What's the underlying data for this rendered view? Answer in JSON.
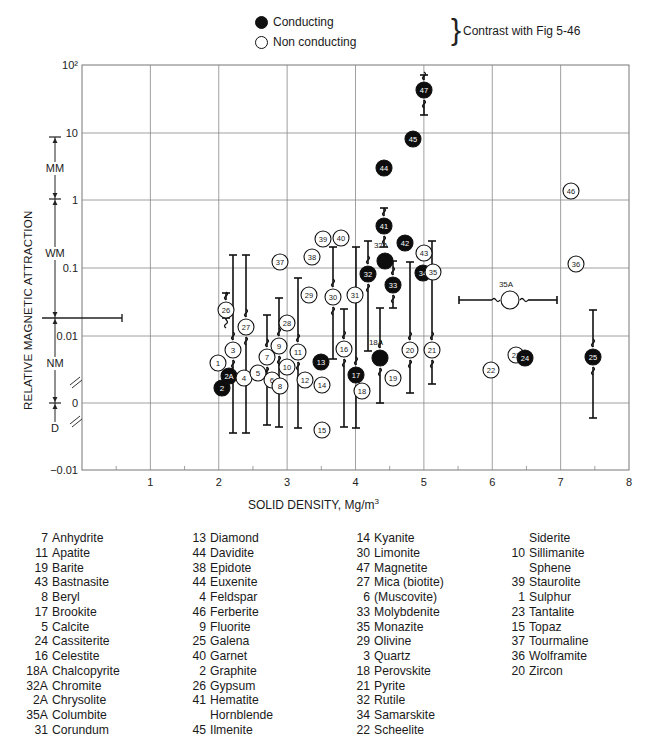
{
  "legend": {
    "conducting_label": "Conducting",
    "nonconducting_label": "Non conducting",
    "contrast_note": "Contrast with Fig 5-46"
  },
  "axes": {
    "x_title": "SOLID DENSITY, Mg/m",
    "x_title_sup": "3",
    "y_title": "RELATIVE MAGNETIC ATTRACTION",
    "x_ticks": [
      "1",
      "2",
      "3",
      "4",
      "5",
      "6",
      "7",
      "8"
    ],
    "y_ticks": [
      "10²",
      "10",
      "1",
      "0.1",
      "0.01",
      "0",
      "−0.01"
    ],
    "zones": [
      {
        "label": "MM",
        "from": "10",
        "to": "1"
      },
      {
        "label": "WM",
        "from": "1",
        "to": "0.02"
      },
      {
        "label": "NM",
        "from": "0.02",
        "to": "0"
      },
      {
        "label": "D",
        "from": "0",
        "to": "below 0"
      }
    ]
  },
  "chart_data": {
    "type": "scatter",
    "title": "",
    "xlabel": "SOLID DENSITY, Mg/m³",
    "ylabel": "RELATIVE MAGNETIC ATTRACTION",
    "xlim": [
      0,
      8
    ],
    "yscale": "log with linear break near 0",
    "y_ticks": [
      100,
      10,
      1,
      0.1,
      0.01,
      0,
      -0.01
    ],
    "x_ticks": [
      1,
      2,
      3,
      4,
      5,
      6,
      7,
      8
    ],
    "grid": true,
    "legend": [
      {
        "marker": "filled-circle",
        "label": "Conducting"
      },
      {
        "marker": "open-circle",
        "label": "Non conducting"
      }
    ],
    "legend_note": "Contrast with Fig 5-46",
    "zones": [
      {
        "label": "MM",
        "range": [
          1,
          10
        ]
      },
      {
        "label": "WM",
        "range": [
          0.02,
          1
        ]
      },
      {
        "label": "NM",
        "range": [
          0,
          0.02
        ]
      },
      {
        "label": "D",
        "range": [
          -0.005,
          0
        ]
      }
    ],
    "points": [
      {
        "id": "1",
        "density": 2.0,
        "px": 218,
        "py": 363,
        "conducting": false
      },
      {
        "id": "2",
        "density": 2.05,
        "px": 222,
        "py": 388,
        "conducting": true
      },
      {
        "id": "2A",
        "density": 2.15,
        "px": 229,
        "py": 376,
        "conducting": true
      },
      {
        "id": "3",
        "density": 2.2,
        "px": 233,
        "py": 350,
        "conducting": false,
        "bar": [
          255,
          433
        ]
      },
      {
        "id": "4",
        "density": 2.37,
        "px": 244,
        "py": 378,
        "conducting": false
      },
      {
        "id": "5",
        "density": 2.58,
        "px": 258,
        "py": 373,
        "conducting": false
      },
      {
        "id": "6",
        "density": 2.78,
        "px": 272,
        "py": 380,
        "conducting": false
      },
      {
        "id": "7",
        "density": 2.71,
        "px": 267,
        "py": 357,
        "conducting": false,
        "bar": [
          315,
          425
        ]
      },
      {
        "id": "8",
        "density": 2.9,
        "px": 280,
        "py": 386,
        "conducting": false
      },
      {
        "id": "9",
        "density": 2.89,
        "px": 279,
        "py": 346,
        "conducting": false,
        "bar": [
          298,
          427
        ]
      },
      {
        "id": "10",
        "density": 3.0,
        "px": 287,
        "py": 367,
        "conducting": false
      },
      {
        "id": "11",
        "density": 3.16,
        "px": 298,
        "py": 352,
        "conducting": false,
        "bar": [
          278,
          428
        ]
      },
      {
        "id": "12",
        "density": 3.26,
        "px": 305,
        "py": 380,
        "conducting": false
      },
      {
        "id": "13",
        "density": 3.5,
        "px": 321,
        "py": 362,
        "conducting": true
      },
      {
        "id": "14",
        "density": 3.51,
        "px": 322,
        "py": 385,
        "conducting": false
      },
      {
        "id": "15",
        "density": 3.51,
        "px": 322,
        "py": 430,
        "conducting": false
      },
      {
        "id": "16",
        "density": 3.84,
        "px": 344,
        "py": 349,
        "conducting": false,
        "bar": [
          309,
          427
        ]
      },
      {
        "id": "17",
        "density": 4.01,
        "px": 356,
        "py": 375,
        "conducting": true,
        "bar": [
          247,
          428
        ]
      },
      {
        "id": "18",
        "density": 4.1,
        "px": 362,
        "py": 391,
        "conducting": false
      },
      {
        "id": "18A",
        "density": 4.36,
        "px": 380,
        "py": 358,
        "conducting": true,
        "bar": [
          308,
          403
        ],
        "label_above": true
      },
      {
        "id": "19",
        "density": 4.55,
        "px": 393,
        "py": 378,
        "conducting": false
      },
      {
        "id": "20",
        "density": 4.8,
        "px": 410,
        "py": 350,
        "conducting": false,
        "bar": [
          262,
          393
        ]
      },
      {
        "id": "21",
        "density": 5.12,
        "px": 432,
        "py": 350,
        "conducting": false,
        "bar": [
          241,
          384
        ]
      },
      {
        "id": "22",
        "density": 5.99,
        "px": 491,
        "py": 370,
        "conducting": false
      },
      {
        "id": "23",
        "density": 6.35,
        "px": 516,
        "py": 355,
        "conducting": false
      },
      {
        "id": "24",
        "density": 6.49,
        "px": 525,
        "py": 358,
        "conducting": true
      },
      {
        "id": "25",
        "density": 7.48,
        "px": 593,
        "py": 357,
        "conducting": true,
        "bar": [
          310,
          418
        ]
      },
      {
        "id": "26",
        "density": 2.11,
        "px": 226,
        "py": 310,
        "conducting": false,
        "bar": [
          293,
          318
        ]
      },
      {
        "id": "27",
        "density": 2.4,
        "px": 246,
        "py": 327,
        "conducting": false,
        "bar": [
          255,
          433
        ]
      },
      {
        "id": "28",
        "density": 3.0,
        "px": 287,
        "py": 323,
        "conducting": false
      },
      {
        "id": "29",
        "density": 3.32,
        "px": 309,
        "py": 295,
        "conducting": false
      },
      {
        "id": "30",
        "density": 3.67,
        "px": 333,
        "py": 297,
        "conducting": false,
        "bar": [
          247,
          359
        ]
      },
      {
        "id": "31",
        "density": 3.99,
        "px": 355,
        "py": 295,
        "conducting": false
      },
      {
        "id": "32",
        "density": 4.19,
        "px": 368,
        "py": 274,
        "conducting": true,
        "bar": [
          241,
          351
        ]
      },
      {
        "id": "32A",
        "density": 4.44,
        "px": 385,
        "py": 261,
        "conducting": true,
        "label_above": true
      },
      {
        "id": "33",
        "density": 4.55,
        "px": 393,
        "py": 285,
        "conducting": true,
        "bar": [
          261,
          308
        ]
      },
      {
        "id": "34",
        "density": 4.99,
        "px": 423,
        "py": 273,
        "conducting": true
      },
      {
        "id": "35",
        "density": 5.14,
        "px": 433,
        "py": 272,
        "conducting": false
      },
      {
        "id": "35A",
        "density": 6.27,
        "px": 510,
        "py": 300,
        "conducting": false,
        "hbar": [
          459,
          557
        ],
        "label_above": true,
        "big": true
      },
      {
        "id": "36",
        "density": 7.23,
        "px": 576,
        "py": 264,
        "conducting": false
      },
      {
        "id": "37",
        "density": 2.9,
        "px": 280,
        "py": 262,
        "conducting": false
      },
      {
        "id": "38",
        "density": 3.37,
        "px": 312,
        "py": 257,
        "conducting": false
      },
      {
        "id": "39",
        "density": 3.53,
        "px": 323,
        "py": 239,
        "conducting": false
      },
      {
        "id": "40",
        "density": 3.79,
        "px": 341,
        "py": 238,
        "conducting": false
      },
      {
        "id": "41",
        "density": 4.42,
        "px": 384,
        "py": 226,
        "conducting": true,
        "bar": [
          208,
          247
        ]
      },
      {
        "id": "42",
        "density": 4.73,
        "px": 405,
        "py": 243,
        "conducting": true
      },
      {
        "id": "43",
        "density": 5.0,
        "px": 424,
        "py": 253,
        "conducting": false
      },
      {
        "id": "44",
        "density": 4.42,
        "px": 384,
        "py": 168,
        "conducting": true
      },
      {
        "id": "45",
        "density": 4.85,
        "px": 413,
        "py": 139,
        "conducting": true
      },
      {
        "id": "46",
        "density": 7.16,
        "px": 571,
        "py": 191,
        "conducting": false
      },
      {
        "id": "47",
        "density": 5.0,
        "px": 424,
        "py": 90,
        "conducting": true,
        "bar": [
          75,
          115
        ]
      }
    ]
  },
  "mineral_key": {
    "col1": [
      {
        "num": "7",
        "name": "Anhydrite"
      },
      {
        "num": "11",
        "name": "Apatite"
      },
      {
        "num": "19",
        "name": "Barite"
      },
      {
        "num": "43",
        "name": "Bastnasite"
      },
      {
        "num": "8",
        "name": "Beryl"
      },
      {
        "num": "17",
        "name": "Brookite"
      },
      {
        "num": "5",
        "name": "Calcite"
      },
      {
        "num": "24",
        "name": "Cassiterite"
      },
      {
        "num": "16",
        "name": "Celestite"
      },
      {
        "num": "18A",
        "name": "Chalcopyrite"
      },
      {
        "num": "32A",
        "name": "Chromite"
      },
      {
        "num": "2A",
        "name": "Chrysolite"
      },
      {
        "num": "35A",
        "name": "Columbite"
      },
      {
        "num": "31",
        "name": "Corundum"
      }
    ],
    "col2": [
      {
        "num": "13",
        "name": "Diamond"
      },
      {
        "num": "44",
        "name": "Davidite"
      },
      {
        "num": "38",
        "name": "Epidote"
      },
      {
        "num": "44",
        "name": "Euxenite"
      },
      {
        "num": "4",
        "name": "Feldspar"
      },
      {
        "num": "46",
        "name": "Ferberite"
      },
      {
        "num": "9",
        "name": "Fluorite"
      },
      {
        "num": "25",
        "name": "Galena"
      },
      {
        "num": "40",
        "name": "Garnet"
      },
      {
        "num": "2",
        "name": "Graphite"
      },
      {
        "num": "26",
        "name": "Gypsum"
      },
      {
        "num": "41",
        "name": "Hematite"
      },
      {
        "num": "",
        "name": "Hornblende"
      },
      {
        "num": "45",
        "name": "Ilmenite"
      }
    ],
    "col3": [
      {
        "num": "14",
        "name": "Kyanite"
      },
      {
        "num": "30",
        "name": "Limonite"
      },
      {
        "num": "47",
        "name": "Magnetite"
      },
      {
        "num": "27",
        "name": "Mica (biotite)"
      },
      {
        "num": "6",
        "name": "(Muscovite)"
      },
      {
        "num": "33",
        "name": "Molybdenite"
      },
      {
        "num": "35",
        "name": "Monazite"
      },
      {
        "num": "29",
        "name": "Olivine"
      },
      {
        "num": "3",
        "name": "Quartz"
      },
      {
        "num": "18",
        "name": "Perovskite"
      },
      {
        "num": "21",
        "name": "Pyrite"
      },
      {
        "num": "32",
        "name": "Rutile"
      },
      {
        "num": "34",
        "name": "Samarskite"
      },
      {
        "num": "22",
        "name": "Scheelite"
      }
    ],
    "col4": [
      {
        "num": "",
        "name": "Siderite"
      },
      {
        "num": "10",
        "name": "Sillimanite"
      },
      {
        "num": "",
        "name": "Sphene"
      },
      {
        "num": "39",
        "name": "Staurolite"
      },
      {
        "num": "1",
        "name": "Sulphur"
      },
      {
        "num": "23",
        "name": "Tantalite"
      },
      {
        "num": "15",
        "name": "Topaz"
      },
      {
        "num": "37",
        "name": "Tourmaline"
      },
      {
        "num": "36",
        "name": "Wolframite"
      },
      {
        "num": "20",
        "name": "Zircon"
      }
    ]
  }
}
